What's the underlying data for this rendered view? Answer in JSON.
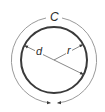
{
  "diagram": {
    "labels": {
      "circumference": "C",
      "diameter": "d",
      "radius": "r"
    },
    "colors": {
      "circle_stroke": "#3a3a3a",
      "arc_stroke": "#9a9a9a",
      "dimension_line": "#6a6a6a",
      "arrow": "#3a3a3a",
      "text": "#2a2a2a",
      "background": "#ffffff"
    }
  }
}
